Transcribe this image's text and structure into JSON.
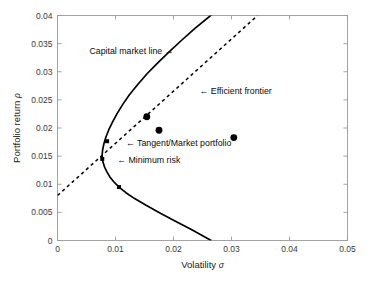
{
  "chart_data": {
    "type": "line",
    "title": "",
    "xlabel": "Volatility σ",
    "ylabel": "Portfolio return ρ",
    "xlim": [
      0,
      0.05
    ],
    "ylim": [
      0,
      0.04
    ],
    "grid": false,
    "legend": "none",
    "xticks": [
      "0",
      "0.01",
      "0.02",
      "0.03",
      "0.04",
      "0.05"
    ],
    "xtick_values": [
      0,
      0.01,
      0.02,
      0.03,
      0.04,
      0.05
    ],
    "yticks": [
      "0",
      "0.005",
      "0.01",
      "0.015",
      "0.02",
      "0.025",
      "0.03",
      "0.035",
      "0.04"
    ],
    "ytick_values": [
      0,
      0.005,
      0.01,
      0.015,
      0.02,
      0.025,
      0.03,
      0.035,
      0.04
    ],
    "series": [
      {
        "name": "Efficient frontier",
        "style": "solid",
        "color": "#000000",
        "x": [
          0.0265,
          0.023,
          0.02,
          0.0175,
          0.0152,
          0.0133,
          0.0118,
          0.0106,
          0.0097,
          0.009,
          0.0085,
          0.0081,
          0.00785,
          0.00772,
          0.0077,
          0.00778,
          0.008,
          0.00835,
          0.00885,
          0.0095,
          0.0103,
          0.01125,
          0.0124,
          0.0138,
          0.0154,
          0.0172,
          0.0192,
          0.0214,
          0.0238,
          0.0264,
          0.0291
        ],
        "y": [
          0.0,
          0.002,
          0.0036,
          0.005,
          0.0063,
          0.00745,
          0.0085,
          0.0095,
          0.01045,
          0.01135,
          0.01225,
          0.0131,
          0.0139,
          0.0145,
          0.0152,
          0.0161,
          0.0172,
          0.0184,
          0.0197,
          0.0211,
          0.0226,
          0.0242,
          0.0259,
          0.0277,
          0.0296,
          0.0315,
          0.0335,
          0.0356,
          0.0378,
          0.04,
          0.0423
        ]
      },
      {
        "name": "Capital market line",
        "style": "dashed",
        "color": "#000000",
        "x": [
          0,
          0.0345
        ],
        "y": [
          0.008,
          0.04
        ]
      }
    ],
    "markers": [
      {
        "name": "tangent-market-portfolio-marker",
        "x": 0.00855,
        "y": 0.01765,
        "shape": "square",
        "size": 4
      },
      {
        "name": "minimum-risk-marker",
        "x": 0.00772,
        "y": 0.0145,
        "shape": "square",
        "size": 4
      },
      {
        "name": "frontier-marker-lower",
        "x": 0.0106,
        "y": 0.0095,
        "shape": "square",
        "size": 4
      },
      {
        "name": "asset-dot-left",
        "x": 0.0175,
        "y": 0.0196,
        "shape": "circle",
        "size": 3.4
      },
      {
        "name": "asset-dot-right",
        "x": 0.0304,
        "y": 0.0183,
        "shape": "circle",
        "size": 3.4
      },
      {
        "name": "asset-dot-upper",
        "x": 0.0154,
        "y": 0.022,
        "shape": "circle",
        "size": 3.4
      }
    ],
    "annotations": [
      {
        "name": "capital-market-line-annotation",
        "text": "Capital market line →",
        "x": 0.0055,
        "y": 0.0338,
        "anchor": "start"
      },
      {
        "name": "efficient-frontier-annotation",
        "text": "← Efficient frontier",
        "x": 0.0245,
        "y": 0.0266,
        "anchor": "start"
      },
      {
        "name": "tangent-market-portfolio-annotation",
        "text": "← Tangent/Market portfolio",
        "x": 0.0118,
        "y": 0.01745,
        "anchor": "start"
      },
      {
        "name": "minimum-risk-annotation",
        "text": "← Minimum risk",
        "x": 0.0103,
        "y": 0.01435,
        "anchor": "start"
      }
    ]
  },
  "axes": {
    "x_label_main": "Volatility",
    "x_label_symbol": "σ",
    "y_label_main": "Portfolio return",
    "y_label_symbol": "ρ"
  }
}
